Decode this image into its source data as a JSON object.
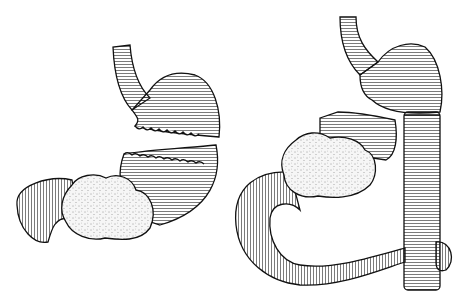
{
  "figure": {
    "panels": [
      {
        "id": "left",
        "description": "Stomach transected with tumor at antrum/pylorus, duodenum on left"
      },
      {
        "id": "right",
        "description": "Remnant stomach anastomosed to jejunal limb, resected specimen with tumor"
      }
    ],
    "colors": {
      "line": "#111111",
      "background": "#ffffff",
      "tumor_fill": "#f4f4f4"
    }
  }
}
